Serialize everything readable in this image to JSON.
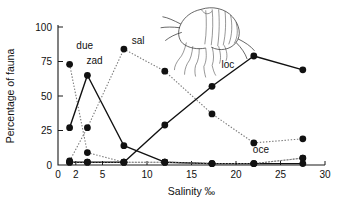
{
  "chart_data": {
    "type": "line",
    "title": "",
    "subtitle": "",
    "xlabel": "Salinity ‰",
    "ylabel": "Percentage of fauna",
    "xlim": [
      0,
      30
    ],
    "ylim": [
      0,
      100
    ],
    "x_ticks": [
      0,
      2,
      5,
      10,
      15,
      20,
      25,
      30
    ],
    "x_tick_labels": [
      "0",
      "2",
      "5",
      "10",
      "15",
      "20",
      "25",
      "30"
    ],
    "y_ticks": [
      0,
      25,
      50,
      75,
      100
    ],
    "y_tick_labels": [
      "0",
      "25",
      "50",
      "75",
      "100"
    ],
    "grid": false,
    "legend": "inline-labels",
    "x": [
      1.3,
      3.3,
      7.4,
      12,
      17.3,
      22,
      27.5
    ],
    "series": [
      {
        "name": "due",
        "label": "due",
        "style": "dotted",
        "color": "#777777",
        "label_x": 3.0,
        "label_y": 84,
        "points": [
          {
            "x": 1.3,
            "y": 73
          },
          {
            "x": 3.3,
            "y": 9
          },
          {
            "x": 7.4,
            "y": 2
          },
          {
            "x": 12,
            "y": 2
          },
          {
            "x": 17.3,
            "y": 1
          },
          {
            "x": 22,
            "y": 1
          },
          {
            "x": 27.5,
            "y": 5
          }
        ]
      },
      {
        "name": "zad",
        "label": "zad",
        "style": "solid",
        "color": "#111111",
        "label_x": 4.1,
        "label_y": 73,
        "points": [
          {
            "x": 1.3,
            "y": 27
          },
          {
            "x": 3.3,
            "y": 65
          },
          {
            "x": 7.4,
            "y": 14
          },
          {
            "x": 12,
            "y": 2
          },
          {
            "x": 17.3,
            "y": 1
          },
          {
            "x": 22,
            "y": 1
          },
          {
            "x": 27.5,
            "y": 1
          }
        ]
      },
      {
        "name": "sal",
        "label": "sal",
        "style": "dotted",
        "color": "#777777",
        "label_x": 9.0,
        "label_y": 88,
        "points": [
          {
            "x": 1.3,
            "y": 3
          },
          {
            "x": 3.3,
            "y": 27
          },
          {
            "x": 7.4,
            "y": 84
          },
          {
            "x": 12,
            "y": 68
          },
          {
            "x": 17.3,
            "y": 37
          },
          {
            "x": 22,
            "y": 16
          },
          {
            "x": 27.5,
            "y": 19
          }
        ]
      },
      {
        "name": "loc",
        "label": "loc",
        "style": "solid",
        "color": "#111111",
        "label_x": 19.1,
        "label_y": 70,
        "points": [
          {
            "x": 1.3,
            "y": 2
          },
          {
            "x": 3.3,
            "y": 2
          },
          {
            "x": 7.4,
            "y": 2
          },
          {
            "x": 12,
            "y": 29
          },
          {
            "x": 17.3,
            "y": 57
          },
          {
            "x": 22,
            "y": 79
          },
          {
            "x": 27.5,
            "y": 69
          }
        ]
      },
      {
        "name": "oce",
        "label": "oce",
        "style": "dotted",
        "color": "#777777",
        "label_x": 22.8,
        "label_y": 9,
        "points": [
          {
            "x": 1.3,
            "y": 2
          },
          {
            "x": 3.3,
            "y": 2
          },
          {
            "x": 7.4,
            "y": 2
          },
          {
            "x": 12,
            "y": 2
          },
          {
            "x": 17.3,
            "y": 1
          },
          {
            "x": 22,
            "y": 1
          },
          {
            "x": 27.5,
            "y": 5
          }
        ]
      }
    ],
    "annotations": [
      {
        "name": "amphipod-illustration",
        "type": "line-drawing",
        "x": 14.5,
        "y": 106
      }
    ]
  }
}
